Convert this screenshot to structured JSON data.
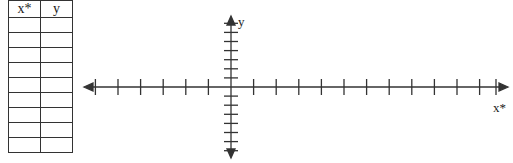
{
  "table": {
    "headers": [
      "x*",
      "y"
    ],
    "rows": [
      [
        "",
        ""
      ],
      [
        "",
        ""
      ],
      [
        "",
        ""
      ],
      [
        "",
        ""
      ],
      [
        "",
        ""
      ],
      [
        "",
        ""
      ],
      [
        "",
        ""
      ],
      [
        "",
        ""
      ],
      [
        "",
        ""
      ]
    ]
  },
  "axes": {
    "x_label": "x*",
    "y_label": "y",
    "x_ticks_left": 6,
    "x_ticks_right": 12,
    "y_ticks_up": 7,
    "y_ticks_down": 7
  }
}
